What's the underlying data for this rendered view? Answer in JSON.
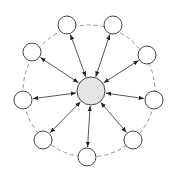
{
  "diagram": {
    "type": "star-topology",
    "colors": {
      "background": "#ffffff",
      "stroke": "#444444",
      "center_fill": "#e6e6e6",
      "node_fill": "#ffffff",
      "ring": "#777777"
    },
    "center": {
      "x": 91,
      "y": 91,
      "r": 14
    },
    "node_radius": 9,
    "ring": {
      "cx": 89,
      "cy": 91,
      "r": 66,
      "style": "dashed"
    },
    "nodes": [
      {
        "x": 67,
        "y": 25
      },
      {
        "x": 113,
        "y": 25
      },
      {
        "x": 147,
        "y": 55
      },
      {
        "x": 154,
        "y": 100
      },
      {
        "x": 133,
        "y": 140
      },
      {
        "x": 87,
        "y": 157
      },
      {
        "x": 43,
        "y": 140
      },
      {
        "x": 23,
        "y": 100
      },
      {
        "x": 32,
        "y": 52
      }
    ],
    "edges": "bidirectional arrows from center to each peripheral node"
  }
}
